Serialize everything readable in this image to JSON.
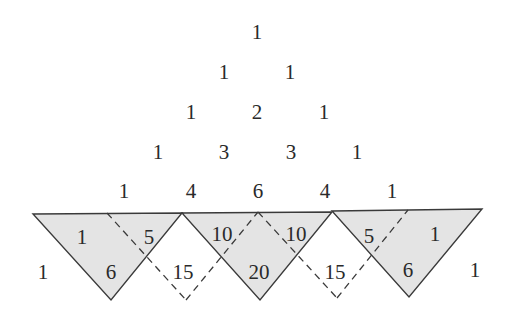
{
  "diagram": {
    "colors": {
      "fill": "#e4e4e4",
      "stroke": "#3a3a3a",
      "text": "#2a2a2a"
    },
    "rows": [
      {
        "values": [
          "1"
        ],
        "y": 32,
        "x": [
          257
        ]
      },
      {
        "values": [
          "1",
          "1"
        ],
        "y": 72,
        "x": [
          224,
          290
        ]
      },
      {
        "values": [
          "1",
          "2",
          "1"
        ],
        "y": 112,
        "x": [
          191,
          257,
          324
        ]
      },
      {
        "values": [
          "1",
          "3",
          "3",
          "1"
        ],
        "y": 152,
        "x": [
          158,
          224,
          291,
          357
        ]
      },
      {
        "values": [
          "1",
          "4",
          "6",
          "4",
          "1"
        ],
        "y": 191,
        "x": [
          124,
          191,
          258,
          325,
          392
        ]
      }
    ],
    "row5_upper": [
      {
        "value": "1",
        "x": 82,
        "y": 237
      },
      {
        "value": "5",
        "x": 149,
        "y": 237
      },
      {
        "value": "10",
        "x": 222,
        "y": 234
      },
      {
        "value": "10",
        "x": 296,
        "y": 234
      },
      {
        "value": "5",
        "x": 369,
        "y": 236
      },
      {
        "value": "1",
        "x": 435,
        "y": 234
      }
    ],
    "row6_lower": [
      {
        "value": "1",
        "x": 43,
        "y": 272
      },
      {
        "value": "6",
        "x": 111,
        "y": 272
      },
      {
        "value": "15",
        "x": 183,
        "y": 272
      },
      {
        "value": "20",
        "x": 259,
        "y": 272
      },
      {
        "value": "15",
        "x": 335,
        "y": 272
      },
      {
        "value": "6",
        "x": 408,
        "y": 270
      },
      {
        "value": "1",
        "x": 475,
        "y": 270
      }
    ],
    "triangles": [
      {
        "points": "33,214 182,213 111,300"
      },
      {
        "points": "182,213 332,212 260,300"
      },
      {
        "points": "332,211 482,209 409,297"
      }
    ],
    "dashed_lines": [
      {
        "x1": 107,
        "y1": 213,
        "x2": 186,
        "y2": 300
      },
      {
        "x1": 186,
        "y1": 300,
        "x2": 258,
        "y2": 212
      },
      {
        "x1": 258,
        "y1": 212,
        "x2": 337,
        "y2": 298
      },
      {
        "x1": 337,
        "y1": 298,
        "x2": 408,
        "y2": 210
      }
    ]
  }
}
